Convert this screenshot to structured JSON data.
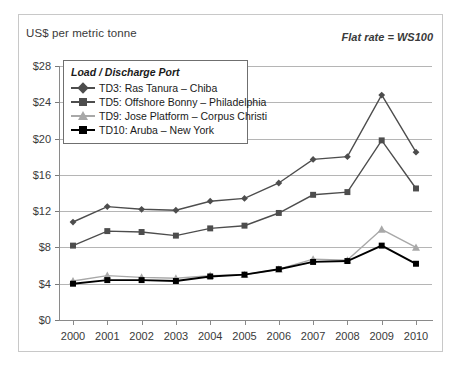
{
  "axis_title": "US$ per metric tonne",
  "annotation": "Flat rate = WS100",
  "legend": {
    "title": "Load / Discharge Port",
    "items": [
      {
        "label": "TD3: Ras Tanura – Chiba",
        "marker": "diamond",
        "color": "#4d4d4d"
      },
      {
        "label": "TD5: Offshore Bonny – Philadelphia",
        "marker": "square",
        "color": "#4d4d4d"
      },
      {
        "label": "TD9: Jose Platform – Corpus Christi",
        "marker": "triangle",
        "color": "#a8a8a8"
      },
      {
        "label": "TD10: Aruba – New York",
        "marker": "square",
        "color": "#000000"
      }
    ]
  },
  "chart_data": {
    "type": "line",
    "title": "",
    "subtitle": "",
    "xlabel": "",
    "ylabel": "US$ per metric tonne",
    "categories": [
      "2000",
      "2001",
      "2002",
      "2003",
      "2004",
      "2005",
      "2006",
      "2007",
      "2008",
      "2009",
      "2010"
    ],
    "ytick_labels": [
      "$0",
      "$4",
      "$8",
      "$12",
      "$16",
      "$20",
      "$24",
      "$28"
    ],
    "ytick_values": [
      0,
      4,
      8,
      12,
      16,
      20,
      24,
      28
    ],
    "ylim": [
      0,
      28
    ],
    "grid": true,
    "legend_position": "upper-left-inside",
    "series": [
      {
        "name": "TD3: Ras Tanura – Chiba",
        "marker": "diamond",
        "color": "#4d4d4d",
        "values": [
          10.8,
          12.5,
          12.2,
          12.1,
          13.1,
          13.4,
          15.1,
          17.7,
          18.0,
          24.8,
          18.5
        ]
      },
      {
        "name": "TD5: Offshore Bonny – Philadelphia",
        "marker": "square",
        "color": "#4d4d4d",
        "values": [
          8.2,
          9.8,
          9.7,
          9.3,
          10.1,
          10.4,
          11.8,
          13.8,
          14.1,
          19.8,
          14.5
        ]
      },
      {
        "name": "TD9: Jose Platform – Corpus Christi",
        "marker": "triangle",
        "color": "#a8a8a8",
        "values": [
          4.3,
          4.9,
          4.7,
          4.6,
          4.9,
          5.0,
          5.6,
          6.7,
          6.6,
          10.0,
          8.0
        ]
      },
      {
        "name": "TD10: Aruba – New York",
        "marker": "square",
        "color": "#000000",
        "values": [
          4.0,
          4.4,
          4.4,
          4.3,
          4.8,
          5.0,
          5.6,
          6.4,
          6.5,
          8.2,
          6.2
        ]
      }
    ]
  }
}
